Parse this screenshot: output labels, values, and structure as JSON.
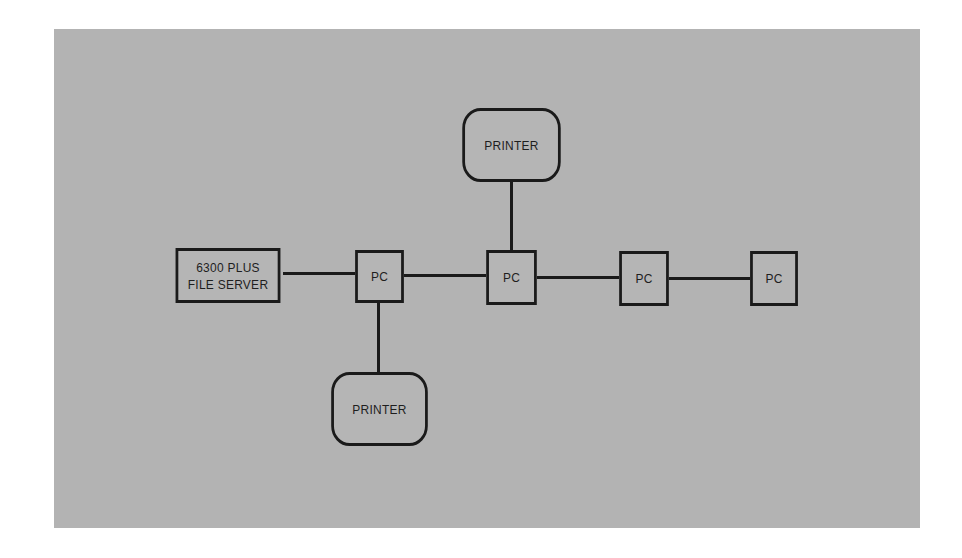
{
  "diagram": {
    "background_color": "#b3b3b3",
    "line_color": "#1a1a1a",
    "nodes": {
      "file_server": {
        "label": "6300 PLUS\nFILE SERVER",
        "type": "server"
      },
      "pc1": {
        "label": "PC",
        "type": "pc"
      },
      "pc2": {
        "label": "PC",
        "type": "pc"
      },
      "pc3": {
        "label": "PC",
        "type": "pc"
      },
      "pc4": {
        "label": "PC",
        "type": "pc"
      },
      "printer_top": {
        "label": "PRINTER",
        "type": "printer"
      },
      "printer_bottom": {
        "label": "PRINTER",
        "type": "printer"
      }
    },
    "edges": [
      [
        "file_server",
        "pc1"
      ],
      [
        "pc1",
        "pc2"
      ],
      [
        "pc2",
        "pc3"
      ],
      [
        "pc3",
        "pc4"
      ],
      [
        "pc2",
        "printer_top"
      ],
      [
        "pc1",
        "printer_bottom"
      ]
    ]
  }
}
